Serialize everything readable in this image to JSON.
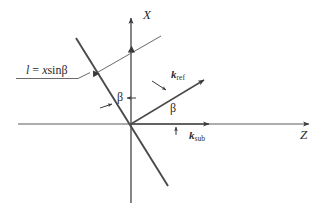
{
  "figure": {
    "type": "vector-geometry-diagram",
    "background_color": "#ffffff",
    "ink_color": "#3a3a3a",
    "axes": {
      "x_axis_label": "X",
      "z_axis_label": "Z"
    },
    "labels": {
      "path_difference": {
        "lhs": "l",
        "equals": " = ",
        "rhs_var": "x",
        "rhs_fn": "sin",
        "rhs_angle": "β",
        "full_text": "l = xsinβ"
      },
      "k_ref": {
        "symbol": "k",
        "subscript": "ref"
      },
      "k_sub": {
        "symbol": "k",
        "subscript": "sub"
      },
      "beta_left": "β",
      "beta_right": "β"
    },
    "geometry": {
      "origin": {
        "x": 131,
        "y": 124
      },
      "x_axis": {
        "x1": 131,
        "y1": 202,
        "x2": 131,
        "y2": 16,
        "arrow_at_top": true
      },
      "z_axis": {
        "x1": 18,
        "y1": 124,
        "x2": 310,
        "y2": 124,
        "arrow_at_right": true
      },
      "grating_line": {
        "x1": 76,
        "y1": 38,
        "x2": 168,
        "y2": 186
      },
      "wavefront_line": {
        "x1": 93,
        "y1": 75,
        "x2": 160,
        "y2": 37
      },
      "k_ref_vector": {
        "x1": 131,
        "y1": 124,
        "x2": 206,
        "y2": 79
      },
      "k_sub_vector": {
        "x1": 131,
        "y1": 124,
        "x2": 211,
        "y2": 124
      },
      "leader_underline": {
        "x1": 18,
        "y1": 78,
        "x2": 80,
        "y2": 78
      },
      "beta_angle_degrees": 32
    }
  }
}
